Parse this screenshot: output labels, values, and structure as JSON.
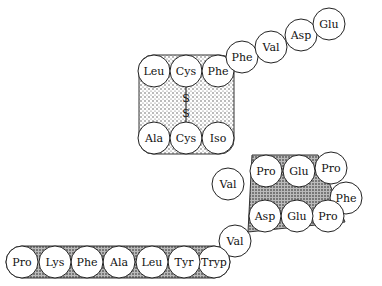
{
  "diagram": {
    "title": "",
    "residues": [
      {
        "id": "r1",
        "label": "Leu",
        "x": 154,
        "y": 71
      },
      {
        "id": "r2",
        "label": "Cys",
        "x": 186,
        "y": 71
      },
      {
        "id": "r3",
        "label": "Phe",
        "x": 218,
        "y": 71
      },
      {
        "id": "r4",
        "label": "Phe",
        "x": 242,
        "y": 57
      },
      {
        "id": "r5",
        "label": "Val",
        "x": 271,
        "y": 47
      },
      {
        "id": "r6",
        "label": "Asp",
        "x": 301,
        "y": 35
      },
      {
        "id": "r7",
        "label": "Glu",
        "x": 329,
        "y": 24
      },
      {
        "id": "r8",
        "label": "Ala",
        "x": 154,
        "y": 138
      },
      {
        "id": "r9",
        "label": "Cys",
        "x": 186,
        "y": 138
      },
      {
        "id": "r10",
        "label": "Iso",
        "x": 218,
        "y": 138
      },
      {
        "id": "r11",
        "label": "Val",
        "x": 228,
        "y": 184
      },
      {
        "id": "r12",
        "label": "Pro",
        "x": 266,
        "y": 171
      },
      {
        "id": "r13",
        "label": "Glu",
        "x": 299,
        "y": 171
      },
      {
        "id": "r14",
        "label": "Pro",
        "x": 331,
        "y": 168
      },
      {
        "id": "r15",
        "label": "Phe",
        "x": 346,
        "y": 198
      },
      {
        "id": "r16",
        "label": "Pro",
        "x": 328,
        "y": 216
      },
      {
        "id": "r17",
        "label": "Glu",
        "x": 297,
        "y": 216
      },
      {
        "id": "r18",
        "label": "Asp",
        "x": 265,
        "y": 216
      },
      {
        "id": "r19",
        "label": "Val",
        "x": 235,
        "y": 241
      },
      {
        "id": "r20",
        "label": "Tryp",
        "x": 214,
        "y": 262
      },
      {
        "id": "r21",
        "label": "Tyr",
        "x": 184,
        "y": 262
      },
      {
        "id": "r22",
        "label": "Leu",
        "x": 152,
        "y": 262
      },
      {
        "id": "r23",
        "label": "Ala",
        "x": 119,
        "y": 262
      },
      {
        "id": "r24",
        "label": "Phe",
        "x": 87,
        "y": 262
      },
      {
        "id": "r25",
        "label": "Lys",
        "x": 55,
        "y": 262
      },
      {
        "id": "r26",
        "label": "Pro",
        "x": 22,
        "y": 262
      }
    ],
    "disulfide": {
      "labels": [
        "S",
        "S"
      ]
    },
    "radius": 16
  }
}
